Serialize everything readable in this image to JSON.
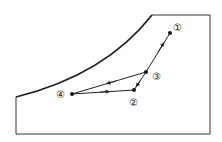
{
  "diagram": {
    "points": [
      {
        "id": "1",
        "label": "①",
        "x": 170,
        "y": 33,
        "lx": 178,
        "ly": 28
      },
      {
        "id": "2",
        "label": "②",
        "x": 134,
        "y": 90,
        "lx": 134,
        "ly": 104
      },
      {
        "id": "3",
        "label": "③",
        "x": 146,
        "y": 72,
        "lx": 157,
        "ly": 79
      },
      {
        "id": "4",
        "label": "④",
        "x": 72,
        "y": 94,
        "lx": 60,
        "ly": 98
      }
    ],
    "stroke": "#222222"
  }
}
